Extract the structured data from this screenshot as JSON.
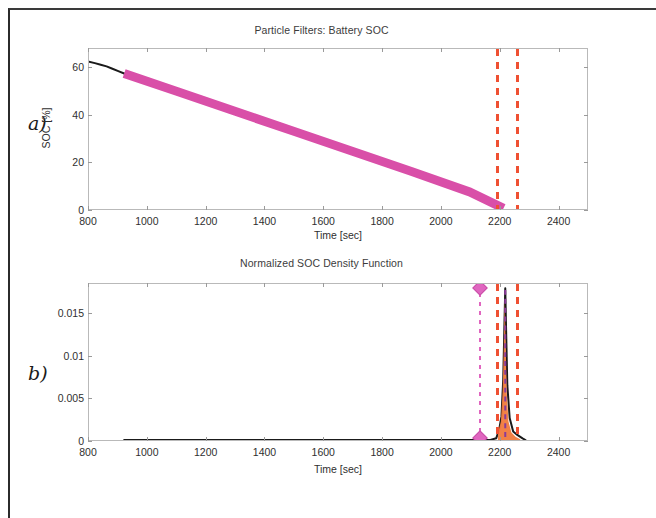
{
  "figure": {
    "panel_a_letter": "a)",
    "panel_b_letter": "b)"
  },
  "chart_data": [
    {
      "type": "line",
      "panel": "a",
      "title": "Particle Filters: Battery SOC",
      "xlabel": "Time [sec]",
      "ylabel": "SOC [%]",
      "xlim": [
        800,
        2500
      ],
      "ylim": [
        0,
        68
      ],
      "xticks": [
        800,
        1000,
        1200,
        1400,
        1600,
        1800,
        2000,
        2200,
        2400
      ],
      "xticklabels": [
        "800",
        "1000",
        "1200",
        "1400",
        "1600",
        "1800",
        "2000",
        "2200",
        "2400"
      ],
      "yticks": [
        0,
        20,
        40,
        60
      ],
      "yticklabels": [
        "0",
        "20",
        "40",
        "60"
      ],
      "grid": false,
      "legend": "none",
      "series": [
        {
          "name": "measured-soc",
          "color": "#1a1a1a",
          "style": "solid",
          "linewidth": 2,
          "x": [
            800,
            820,
            840,
            860,
            880,
            900,
            920
          ],
          "y": [
            62.6,
            62.0,
            61.3,
            60.6,
            59.6,
            58.6,
            57.6
          ]
        },
        {
          "name": "particle-filter-soc-band",
          "color": "#d94fa8",
          "style": "band",
          "linewidth": 9,
          "x": [
            920,
            1100,
            1300,
            1500,
            1700,
            1900,
            2100,
            2215
          ],
          "y": [
            57.6,
            50.0,
            41.5,
            33.0,
            24.5,
            16.0,
            7.2,
            0.3
          ]
        }
      ],
      "vertical_lines": [
        {
          "name": "eol-lower-bound",
          "x": 2190,
          "color": "#ef5032",
          "style": "dashed"
        },
        {
          "name": "eol-upper-bound",
          "x": 2256,
          "color": "#ef5032",
          "style": "dashed"
        }
      ]
    },
    {
      "type": "line",
      "panel": "b",
      "title": "Normalized SOC Density Function",
      "xlabel": "Time [sec]",
      "ylabel": "",
      "xlim": [
        800,
        2500
      ],
      "ylim": [
        0,
        0.0185
      ],
      "xticks": [
        800,
        1000,
        1200,
        1400,
        1600,
        1800,
        2000,
        2200,
        2400
      ],
      "xticklabels": [
        "800",
        "1000",
        "1200",
        "1400",
        "1600",
        "1800",
        "2000",
        "2200",
        "2400"
      ],
      "yticks": [
        0,
        0.005,
        0.01,
        0.015
      ],
      "yticklabels": [
        "0",
        "0.005",
        "0.01",
        "0.015"
      ],
      "grid": false,
      "legend": "none",
      "series": [
        {
          "name": "soc-density-function",
          "color": "#1a1a1a",
          "style": "solid",
          "linewidth": 2,
          "x": [
            920,
            1400,
            1800,
            2100,
            2170,
            2190,
            2200,
            2208,
            2214,
            2218,
            2221,
            2224,
            2228,
            2236,
            2248,
            2262,
            2280,
            2290
          ],
          "y": [
            0.0,
            0.0,
            0.0,
            0.0,
            0.0,
            0.0002,
            0.0012,
            0.0028,
            0.0072,
            0.0135,
            0.018,
            0.0128,
            0.0065,
            0.0026,
            0.001,
            0.0006,
            0.0002,
            0.0
          ]
        },
        {
          "name": "soc-density-fill",
          "color": "#f07a3c",
          "style": "fill",
          "x": [
            2196,
            2206,
            2212,
            2216,
            2219,
            2222,
            2226,
            2232,
            2242,
            2256,
            2272
          ],
          "y": [
            0.0008,
            0.0022,
            0.0058,
            0.0112,
            0.0168,
            0.0118,
            0.0056,
            0.0022,
            0.0009,
            0.0004,
            0.0001
          ]
        }
      ],
      "vertical_lines": [
        {
          "name": "expected-eol-marker",
          "x": 2130,
          "color": "#e066c0",
          "style": "dash-dot",
          "markers": "diamond"
        },
        {
          "name": "eol-lower-bound",
          "x": 2190,
          "color": "#ef5032",
          "style": "dashed"
        },
        {
          "name": "eol-upper-bound",
          "x": 2256,
          "color": "#ef5032",
          "style": "dashed"
        },
        {
          "name": "density-median",
          "x": 2221,
          "color": "#8a3a9a",
          "style": "dashed"
        }
      ]
    }
  ]
}
